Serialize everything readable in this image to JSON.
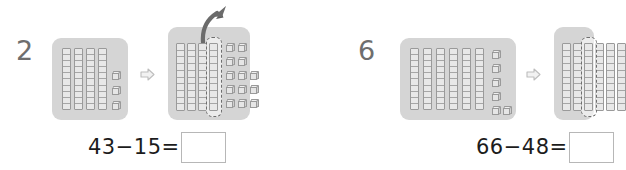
{
  "worksheet": {
    "title": "Base-ten block subtraction with regrouping",
    "colors": {
      "panel_fill": "#d5d5d5",
      "rod_fill": "#e8e8e8",
      "rod_stroke": "#9a9a9a",
      "item_number": "#6e6e6e",
      "equation_text": "#1c1c1c",
      "answer_box_border": "#b7b7b7",
      "step_arrow": "#c9c9c9",
      "curved_arrow": "#6b6b6b",
      "selection_dash": "#6f6f6f"
    },
    "problems": [
      {
        "item_number": "2",
        "equation": {
          "minuend": "43",
          "minus_sign": "−",
          "subtrahend": "15",
          "equals_sign": "=",
          "full_text": "43−15=",
          "answer_value": "",
          "answer_placeholder": ""
        },
        "before": {
          "label": "before-regrouping",
          "tens_rods": 4,
          "unit_cubes": 3,
          "total": 43
        },
        "after": {
          "label": "after-regrouping",
          "tens_rods": 3,
          "decomposed_rod": 1,
          "unit_cubes": 13,
          "total": 43
        },
        "step_arrow_icon": "right-arrow-icon",
        "curved_arrow_icon": "curved-up-arrow-icon"
      },
      {
        "item_number": "6",
        "equation": {
          "minuend": "66",
          "minus_sign": "−",
          "subtrahend": "48",
          "equals_sign": "=",
          "full_text": "66−48=",
          "answer_value": "",
          "answer_placeholder": ""
        },
        "before": {
          "label": "before-regrouping",
          "tens_rods": 6,
          "unit_cubes": 6,
          "total": 66
        },
        "after": {
          "label": "after-regrouping-clipped",
          "tens_rods": 6,
          "decomposed_rod": 1,
          "unit_cubes": 0,
          "total": 66
        },
        "step_arrow_icon": "right-arrow-icon",
        "curved_arrow_icon": "curved-up-arrow-icon"
      }
    ]
  }
}
